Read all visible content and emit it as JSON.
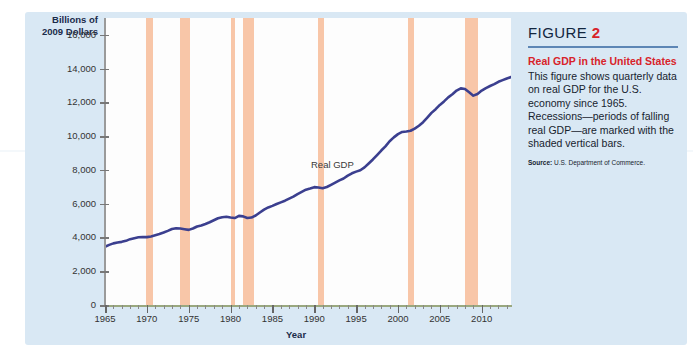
{
  "figure": {
    "head_word": "FIGURE",
    "head_number": "2",
    "title": "Real GDP in the United States",
    "body": "This figure shows quarterly data on real GDP for the U.S. economy since 1965. Recessions—periods of falling real GDP—are marked with the shaded vertical bars.",
    "source_label": "Source:",
    "source_text": "U.S. Department of Commerce.",
    "colors": {
      "panel": "#d9e8f4",
      "accent_red": "#d8232a",
      "line_navy": "#3b3f8f",
      "recession_bar": "#f8c6a8",
      "rule_blue": "#5d86b5"
    }
  },
  "chart_data": {
    "type": "line",
    "title": "Real GDP in the United States",
    "xlabel": "Year",
    "ylabel": "Billions of 2009 Dollars",
    "ylabel_line1": "Billions of",
    "ylabel_line2": "2009 Dollars",
    "series_annotation": "Real GDP",
    "xlim": [
      1965,
      2013.5
    ],
    "ylim": [
      0,
      17000
    ],
    "yticks": [
      0,
      2000,
      4000,
      6000,
      8000,
      10000,
      12000,
      14000,
      16000
    ],
    "ytick_labels": [
      "0",
      "2,000",
      "4,000",
      "6,000",
      "8,000",
      "10,000",
      "12,000",
      "14,000",
      "16,000"
    ],
    "xticks": [
      1965,
      1970,
      1975,
      1980,
      1985,
      1990,
      1995,
      2000,
      2005,
      2010
    ],
    "xtick_labels": [
      "1965",
      "1970",
      "1975",
      "1980",
      "1985",
      "1990",
      "1995",
      "2000",
      "2005",
      "2010"
    ],
    "grid": false,
    "legend": "none",
    "series": [
      {
        "name": "Real GDP",
        "color": "#3b3f8f",
        "x": [
          1965.0,
          1965.5,
          1966.0,
          1966.5,
          1967.0,
          1967.5,
          1968.0,
          1968.5,
          1969.0,
          1969.5,
          1970.0,
          1970.5,
          1971.0,
          1971.5,
          1972.0,
          1972.5,
          1973.0,
          1973.5,
          1974.0,
          1974.5,
          1975.0,
          1975.5,
          1976.0,
          1976.5,
          1977.0,
          1977.5,
          1978.0,
          1978.5,
          1979.0,
          1979.5,
          1980.0,
          1980.5,
          1981.0,
          1981.5,
          1982.0,
          1982.5,
          1983.0,
          1983.5,
          1984.0,
          1984.5,
          1985.0,
          1985.5,
          1986.0,
          1986.5,
          1987.0,
          1987.5,
          1988.0,
          1988.5,
          1989.0,
          1989.5,
          1990.0,
          1990.5,
          1991.0,
          1991.5,
          1992.0,
          1992.5,
          1993.0,
          1993.5,
          1994.0,
          1994.5,
          1995.0,
          1995.5,
          1996.0,
          1996.5,
          1997.0,
          1997.5,
          1998.0,
          1998.5,
          1999.0,
          1999.5,
          2000.0,
          2000.5,
          2001.0,
          2001.5,
          2002.0,
          2002.5,
          2003.0,
          2003.5,
          2004.0,
          2004.5,
          2005.0,
          2005.5,
          2006.0,
          2006.5,
          2007.0,
          2007.5,
          2008.0,
          2008.5,
          2009.0,
          2009.5,
          2010.0,
          2010.5,
          2011.0,
          2011.5,
          2012.0,
          2012.5,
          2013.0,
          2013.5
        ],
        "y": [
          3450,
          3560,
          3650,
          3700,
          3740,
          3800,
          3900,
          3960,
          4010,
          4030,
          4020,
          4060,
          4130,
          4200,
          4290,
          4390,
          4500,
          4550,
          4530,
          4490,
          4450,
          4530,
          4650,
          4710,
          4800,
          4900,
          5020,
          5140,
          5200,
          5230,
          5180,
          5150,
          5280,
          5250,
          5150,
          5180,
          5300,
          5480,
          5650,
          5780,
          5870,
          5980,
          6080,
          6180,
          6300,
          6420,
          6570,
          6700,
          6830,
          6900,
          6980,
          6960,
          6920,
          6990,
          7120,
          7250,
          7380,
          7490,
          7660,
          7800,
          7900,
          7980,
          8150,
          8380,
          8620,
          8880,
          9150,
          9400,
          9700,
          9930,
          10120,
          10250,
          10280,
          10320,
          10450,
          10620,
          10830,
          11100,
          11380,
          11600,
          11850,
          12060,
          12300,
          12480,
          12700,
          12830,
          12790,
          12600,
          12400,
          12500,
          12700,
          12850,
          12970,
          13080,
          13220,
          13320,
          13420,
          13500
        ]
      }
    ],
    "recessions": [
      {
        "label": "1969-70",
        "start": 1969.9,
        "end": 1970.7
      },
      {
        "label": "1973-75",
        "start": 1973.9,
        "end": 1975.1
      },
      {
        "label": "1980",
        "start": 1980.0,
        "end": 1980.5
      },
      {
        "label": "1981-82",
        "start": 1981.5,
        "end": 1982.8
      },
      {
        "label": "1990-91",
        "start": 1990.5,
        "end": 1991.2
      },
      {
        "label": "2001",
        "start": 2001.2,
        "end": 2001.9
      },
      {
        "label": "2007-09",
        "start": 2008.0,
        "end": 2009.5
      }
    ]
  }
}
